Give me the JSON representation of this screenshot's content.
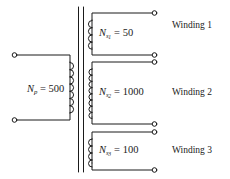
{
  "figure": {
    "type": "transformer-schematic",
    "colors": {
      "line": "#1a1a1a",
      "background": "#ffffff",
      "text": "#1a1a1a"
    }
  },
  "primary": {
    "symbol": "N",
    "subscript": "p",
    "equals": "=",
    "turns": "500",
    "full_label": "N_p = 500",
    "terminals": 2,
    "coil_loops": 7
  },
  "secondaries": [
    {
      "symbol": "N",
      "subscript": "s",
      "subscript2": "1",
      "equals": "=",
      "turns": "50",
      "full_label": "N_s1 = 50",
      "name": "Winding 1",
      "coil_loops": 4,
      "terminals": 2
    },
    {
      "symbol": "N",
      "subscript": "s",
      "subscript2": "2",
      "equals": "=",
      "turns": "1000",
      "full_label": "N_s2 = 1000",
      "name": "Winding 2",
      "coil_loops": 9,
      "terminals": 2
    },
    {
      "symbol": "N",
      "subscript": "s",
      "subscript2": "3",
      "equals": "=",
      "turns": "100",
      "full_label": "N_s3 = 100",
      "name": "Winding 3",
      "coil_loops": 4,
      "terminals": 2
    }
  ],
  "core": {
    "name": "iron-core",
    "line_count": 2
  }
}
